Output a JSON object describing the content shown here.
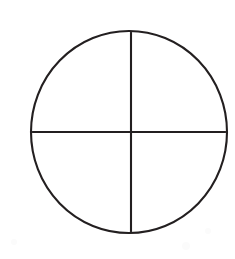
{
  "figure": {
    "background_color": "#ffffff",
    "stroke_color": "#231f20",
    "stroke_width": 2.1,
    "canvas": {
      "width": 235,
      "height": 259
    }
  },
  "chart_data": {
    "type": "diagram",
    "title": "",
    "shape": "circle-quartered",
    "circle": {
      "center_x": 129,
      "center_y": 132,
      "radius_x": 98,
      "radius_y": 101,
      "left_x": 31,
      "right_x": 227,
      "top_y": 31,
      "bottom_y": 233
    },
    "dividers": [
      {
        "name": "vertical-diameter",
        "orientation": "vertical",
        "x1": 131,
        "y1": 31,
        "x2": 131,
        "y2": 233
      },
      {
        "name": "horizontal-diameter",
        "orientation": "horizontal",
        "x1": 31,
        "y1": 132,
        "x2": 227,
        "y2": 132
      }
    ],
    "quadrants": [
      {
        "name": "upper-left",
        "label": ""
      },
      {
        "name": "upper-right",
        "label": ""
      },
      {
        "name": "lower-left",
        "label": ""
      },
      {
        "name": "lower-right",
        "label": ""
      }
    ],
    "intersection": {
      "x": 131,
      "y": 132
    },
    "labels": [],
    "annotations": [],
    "legend": [],
    "grid": false
  }
}
